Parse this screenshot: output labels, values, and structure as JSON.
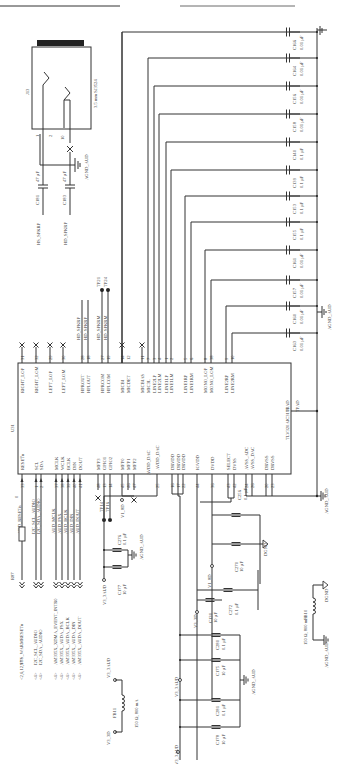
{
  "title_rule": true,
  "ic": {
    "ref": "U31",
    "part": "TLV320AIC3106",
    "left_pins": [
      {
        "num": "33",
        "name": "RESET̅n",
        "net": "AUD_RESETn"
      },
      {
        "num": "1",
        "name": "SCL",
        "net": "I2C_SCL_AUDIO"
      },
      {
        "num": "2",
        "name": "SDA",
        "net": "I2C_SDA_AUDIO"
      },
      {
        "num": "37",
        "name": "MCLK",
        "net": "AUD_MCLK"
      },
      {
        "num": "38",
        "name": "WCLK",
        "net": "AUD_FSX"
      },
      {
        "num": "39",
        "name": "BCLK",
        "net": "AUD_BCLK"
      },
      {
        "num": "40",
        "name": "DIN",
        "net": "AUD_DIN"
      },
      {
        "num": "41",
        "name": "DOUT",
        "net": "AUD_DOUT"
      },
      {
        "num": "48",
        "name": "MFP3",
        "net": ""
      },
      {
        "num": "13",
        "name": "GPIO1",
        "net": "TP14"
      },
      {
        "num": "14",
        "name": "GPIO2",
        "net": "TP16"
      },
      {
        "num": "45",
        "name": "MFP0",
        "net": "V1_8D"
      },
      {
        "num": "46",
        "name": "MFP1",
        "net": ""
      },
      {
        "num": "47",
        "name": "MFP2",
        "net": ""
      },
      {
        "num": "25",
        "name": "AVDD_DAC",
        "net": ""
      },
      {
        "num": "16",
        "name": "DRVDD",
        "net": ""
      },
      {
        "num": "17",
        "name": "DRVDD",
        "net": ""
      },
      {
        "num": "22",
        "name": "DRVDD",
        "net": ""
      },
      {
        "num": "44",
        "name": "IOVDD",
        "net": ""
      },
      {
        "num": "36",
        "name": "DVDD",
        "net": ""
      },
      {
        "num": "43",
        "name": "SELECT",
        "net": ""
      },
      {
        "num": "42",
        "name": "DVSS",
        "net": ""
      },
      {
        "num": "24",
        "name": "AVSS_ADC",
        "net": ""
      },
      {
        "num": "26",
        "name": "AVSS_DAC",
        "net": ""
      },
      {
        "num": "20",
        "name": "DRVSS",
        "net": ""
      },
      {
        "num": "23",
        "name": "DRVSS",
        "net": ""
      }
    ],
    "right_pins": [
      {
        "num": "31",
        "name": "RIGHT_LOP"
      },
      {
        "num": "32",
        "name": "RIGHT_LOM"
      },
      {
        "num": "29",
        "name": "LEFT_LOP"
      },
      {
        "num": "30",
        "name": "LEFT_LOM"
      },
      {
        "num": "28",
        "name": "HPROUT"
      },
      {
        "num": "18",
        "name": "HPLOUT"
      },
      {
        "num": "27",
        "name": "HPRCOM"
      },
      {
        "num": "19",
        "name": "HPLCOM"
      },
      {
        "num": "14",
        "name": "MICBI"
      },
      {
        "num": "12",
        "name": "MICDET"
      },
      {
        "num": "11",
        "name": "MICBIAS"
      },
      {
        "num": "7",
        "name": "MIC3L"
      },
      {
        "num": "3",
        "name": "LINE2LP"
      },
      {
        "num": "4",
        "name": "LINE2LM"
      },
      {
        "num": "1",
        "name": "LINE1LP"
      },
      {
        "num": "2",
        "name": "LINE1LM"
      },
      {
        "num": "5",
        "name": "LINE1RP"
      },
      {
        "num": "6",
        "name": "LINE1RM"
      },
      {
        "num": "8",
        "name": "MONO_LOP"
      },
      {
        "num": "38",
        "name": "MONO_LOM"
      },
      {
        "num": "9",
        "name": "LINE2RP"
      },
      {
        "num": "10",
        "name": "LINE2RM"
      }
    ],
    "thermal_pad": "TPAD",
    "thermal_pad_inner": "TPAD"
  },
  "nets": {
    "hd_spkrp": "HD_SPKRP",
    "hd_spkrp2": "HD_SPKRP",
    "hd_spkrm": "HD_SPKRM",
    "hd_spkrm2": "HD_SPKRM",
    "tp21": "TP21",
    "tp24": "TP24",
    "aud_resetn": "AUD_RESETn",
    "i2c_scl": "I2C_SCL_AUDIO",
    "i2c_sda": "I2C_SDA_AUDIO",
    "aud_mclk": "AUD_MCLK",
    "aud_fsx": "AUD_FSX",
    "aud_bclk": "AUD_BCLK",
    "aud_din": "AUD_DIN",
    "aud_dout": "AUD_DOUT",
    "tp14": "TP14",
    "tp16": "TP16",
    "v1_8d": "V1_8D",
    "v3_3aud": "V3_3AUD",
    "v3_3d": "V3_3D",
    "agnd_aud": "AGND_AUD",
    "dgnd": "DGND",
    "avdd_dac": "AVDD_DAC"
  },
  "connectors": [
    {
      "dir": "<2,6,12,17>",
      "net": "SYS_WARMRESETn"
    },
    {
      "dir": "<4>",
      "net": "I2C_SCL_AUDIO"
    },
    {
      "dir": "<4>",
      "net": "I2C_SDA_AUDIO"
    },
    {
      "dir": "<4>",
      "net": "AM335X_XDMA_EVENT_INTR0"
    },
    {
      "dir": "<4>",
      "net": "AM335X_AUDA_FSX"
    },
    {
      "dir": "<4>",
      "net": "AM335X_AUDA_BCLK"
    },
    {
      "dir": "<4>",
      "net": "AM335X_AUDA_DIN"
    },
    {
      "dir": "<4>",
      "net": "AM335X_AUDA_DOUT"
    }
  ],
  "resistor": {
    "ref": "R87",
    "value": "0"
  },
  "jack": {
    "ref": "J13",
    "desc": "3.5 mm SJ3524",
    "pin_gnd": "1",
    "pin_sw": "10",
    "pin_r": "2",
    "pin_l": "3"
  },
  "hp_caps": [
    {
      "ref": "C181",
      "value": "47 µF",
      "net": "HS_SPKRP"
    },
    {
      "ref": "C183",
      "value": "47 µF",
      "net": "HD_SPKRP"
    }
  ],
  "filter_caps": [
    {
      "ref": "C166",
      "value": "0.01 µF"
    },
    {
      "ref": "C164",
      "value": "0.01 µF"
    },
    {
      "ref": "C156",
      "value": "0.01 µF"
    },
    {
      "ref": "C158",
      "value": "0.01 µF"
    },
    {
      "ref": "C140",
      "value": "0.1 µF"
    },
    {
      "ref": "C139",
      "value": "0.1 µF"
    },
    {
      "ref": "C153",
      "value": "0.1 µF"
    },
    {
      "ref": "C155",
      "value": "0.1 µF"
    },
    {
      "ref": "C161",
      "value": "0.01 µF"
    },
    {
      "ref": "C157",
      "value": "0.01 µF"
    },
    {
      "ref": "C160",
      "value": "0.01 µF"
    },
    {
      "ref": "C163",
      "value": "0.01 µF"
    }
  ],
  "decoupling_caps": [
    {
      "ref": "C276",
      "value": "0.1 µF"
    },
    {
      "ref": "C177",
      "value": "10 µF"
    },
    {
      "ref": "C256",
      "value": "0.1 µF"
    },
    {
      "ref": "C270",
      "value": "10 µF"
    },
    {
      "ref": "C272",
      "value": "0.1 µF"
    },
    {
      "ref": "C130",
      "value": "10 µF"
    },
    {
      "ref": "C280",
      "value": "0.1 µF"
    },
    {
      "ref": "C175",
      "value": "10 µF"
    },
    {
      "ref": "C281",
      "value": "0.1 µF"
    },
    {
      "ref": "C178",
      "value": "10 µF"
    }
  ],
  "ferrites": [
    {
      "ref": "FB11",
      "value": "150 Ω, 800 mA",
      "from": "V3_3D",
      "to": "V3_3AUD"
    },
    {
      "ref": "FB10",
      "value": "150 Ω, 800 mA",
      "from": "AGND_AUD",
      "to": "DGND"
    }
  ]
}
